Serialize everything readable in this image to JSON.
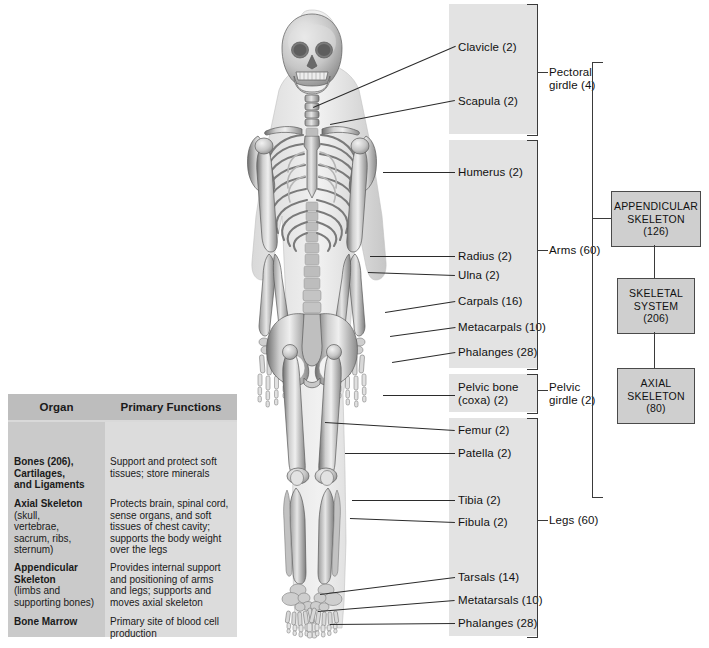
{
  "figure": {
    "kind": "anatomical-diagram"
  },
  "bands": [
    {
      "name": "pectoral-band",
      "x": 449,
      "y": 4,
      "w": 88,
      "h": 130
    },
    {
      "name": "arms-band",
      "x": 449,
      "y": 140,
      "w": 88,
      "h": 228
    },
    {
      "name": "pelvic-band",
      "x": 449,
      "y": 374,
      "w": 88,
      "h": 38
    },
    {
      "name": "legs-band",
      "x": 449,
      "y": 418,
      "w": 88,
      "h": 218
    }
  ],
  "bone_labels": [
    {
      "id": "clavicle",
      "text": "Clavicle (2)",
      "x": 458,
      "y": 41,
      "lead": {
        "x1": 313,
        "y1": 107,
        "x2": 455,
        "y2": 46
      }
    },
    {
      "id": "scapula",
      "text": "Scapula (2)",
      "x": 458,
      "y": 95,
      "lead": {
        "x1": 330,
        "y1": 124,
        "x2": 455,
        "y2": 100
      }
    },
    {
      "id": "humerus",
      "text": "Humerus (2)",
      "x": 458,
      "y": 166,
      "lead": {
        "x1": 383,
        "y1": 172,
        "x2": 455,
        "y2": 172
      }
    },
    {
      "id": "radius",
      "text": "Radius (2)",
      "x": 458,
      "y": 250,
      "lead": {
        "x1": 370,
        "y1": 256,
        "x2": 455,
        "y2": 256
      }
    },
    {
      "id": "ulna",
      "text": "Ulna (2)",
      "x": 458,
      "y": 269,
      "lead": {
        "x1": 368,
        "y1": 272,
        "x2": 455,
        "y2": 275
      }
    },
    {
      "id": "carpals",
      "text": "Carpals (16)",
      "x": 458,
      "y": 295,
      "lead": {
        "x1": 385,
        "y1": 312,
        "x2": 455,
        "y2": 301
      }
    },
    {
      "id": "metacarpals",
      "text": "Metacarpals (10)",
      "x": 458,
      "y": 321,
      "lead": {
        "x1": 390,
        "y1": 336,
        "x2": 455,
        "y2": 327
      }
    },
    {
      "id": "phalanges-hand",
      "text": "Phalanges (28)",
      "x": 458,
      "y": 346,
      "lead": {
        "x1": 392,
        "y1": 362,
        "x2": 455,
        "y2": 352
      }
    },
    {
      "id": "pelvic-bone",
      "text": "Pelvic bone\n(coxa) (2)",
      "x": 458,
      "y": 381,
      "lead": {
        "x1": 383,
        "y1": 395,
        "x2": 455,
        "y2": 395
      }
    },
    {
      "id": "femur",
      "text": "Femur (2)",
      "x": 458,
      "y": 424,
      "lead": {
        "x1": 325,
        "y1": 422,
        "x2": 455,
        "y2": 430
      }
    },
    {
      "id": "patella",
      "text": "Patella (2)",
      "x": 458,
      "y": 447,
      "lead": {
        "x1": 345,
        "y1": 453,
        "x2": 455,
        "y2": 453
      }
    },
    {
      "id": "tibia",
      "text": "Tibia (2)",
      "x": 458,
      "y": 494,
      "lead": {
        "x1": 352,
        "y1": 500,
        "x2": 455,
        "y2": 500
      }
    },
    {
      "id": "fibula",
      "text": "Fibula (2)",
      "x": 458,
      "y": 516,
      "lead": {
        "x1": 350,
        "y1": 518,
        "x2": 455,
        "y2": 522
      }
    },
    {
      "id": "tarsals",
      "text": "Tarsals (14)",
      "x": 458,
      "y": 571,
      "lead": {
        "x1": 320,
        "y1": 594,
        "x2": 455,
        "y2": 577
      }
    },
    {
      "id": "metatarsals",
      "text": "Metatarsals (10)",
      "x": 458,
      "y": 594,
      "lead": {
        "x1": 318,
        "y1": 611,
        "x2": 455,
        "y2": 600
      }
    },
    {
      "id": "phalanges-foot",
      "text": "Phalanges (28)",
      "x": 458,
      "y": 617,
      "lead": {
        "x1": 330,
        "y1": 624,
        "x2": 455,
        "y2": 623
      }
    }
  ],
  "groups": [
    {
      "id": "pectoral-girdle",
      "text": "Pectoral\ngirdle (4)",
      "x": 549,
      "y": 66,
      "brk_y": 4,
      "brk_h": 130,
      "tick_y": 72
    },
    {
      "id": "arms",
      "text": "Arms (60)",
      "x": 549,
      "y": 244,
      "brk_y": 140,
      "brk_h": 228,
      "tick_y": 250
    },
    {
      "id": "pelvic-girdle",
      "text": "Pelvic\ngirdle (2)",
      "x": 549,
      "y": 381,
      "brk_y": 374,
      "brk_h": 38,
      "tick_y": 390
    },
    {
      "id": "legs",
      "text": "Legs (60)",
      "x": 549,
      "y": 514,
      "brk_y": 418,
      "brk_h": 218,
      "tick_y": 520
    }
  ],
  "flow_boxes": [
    {
      "id": "appendicular-skeleton",
      "lines": [
        "APPENDICULAR",
        "SKELETON",
        "(126)"
      ],
      "x": 611,
      "y": 191,
      "w": 88,
      "h": 54
    },
    {
      "id": "skeletal-system",
      "lines": [
        "SKELETAL",
        "SYSTEM",
        "(206)"
      ],
      "x": 617,
      "y": 278,
      "w": 76,
      "h": 54
    },
    {
      "id": "axial-skeleton",
      "lines": [
        "AXIAL",
        "SKELETON",
        "(80)"
      ],
      "x": 617,
      "y": 368,
      "w": 76,
      "h": 54
    }
  ],
  "table": {
    "headers": [
      "Organ",
      "Primary Functions"
    ],
    "rows": [
      {
        "organ": "Bones (206),\n  Cartilages,\n and Ligaments",
        "function": "Support and protect soft\ntissues; store minerals",
        "organ_y": 34,
        "fn_y": 34
      },
      {
        "organ": "Axial Skeleton",
        "organ_sub": "(skull,\nvertebrae,\nsacrum, ribs,\nsternum)",
        "function": "Protects brain, spinal cord,\nsense organs, and soft\ntissues of chest cavity;\nsupports the body weight\nover the legs",
        "organ_y": 76,
        "fn_y": 76
      },
      {
        "organ": "Appendicular\n Skeleton",
        "organ_sub": "(limbs and\nsupporting bones)",
        "function": "Provides internal support\nand positioning of arms\nand legs; supports and\nmoves axial skeleton",
        "organ_y": 140,
        "fn_y": 140
      },
      {
        "organ": "Bone Marrow",
        "organ_sub": "",
        "function": "Primary site of blood cell\nproduction",
        "organ_y": 194,
        "fn_y": 194
      }
    ]
  },
  "colors": {
    "band": "#e3e3e3",
    "box_fill": "#cfcfcf",
    "box_border": "#4a4a4a",
    "table_header": "#bdbdbd",
    "table_col_left": "#cacaca",
    "table_col_right": "#dcdcdc",
    "line": "#2b2b2b"
  }
}
